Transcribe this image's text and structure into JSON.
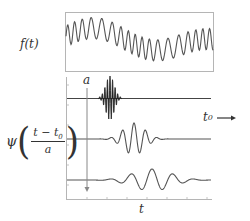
{
  "figure": {
    "signal_label": "f(t)",
    "wavelet_label": {
      "symbol": "ψ",
      "numerator": "t − t",
      "numerator_sub": "0",
      "denominator": "a"
    },
    "scale_label": "a",
    "shift_label": "t",
    "shift_label_sub": "0",
    "time_axis_label": "t",
    "colors": {
      "line": "#555555",
      "frame": "#aaaaaa",
      "burst": "#222222"
    },
    "rows": [
      {
        "name": "compressed-wavelet",
        "baseline_y": 98,
        "center_x": 110,
        "width": 9,
        "amplitude": 22
      },
      {
        "name": "medium-wavelet",
        "baseline_y": 139,
        "center_x": 134,
        "width": 22,
        "amplitude": 16
      },
      {
        "name": "dilated-wavelet",
        "baseline_y": 180,
        "center_x": 152,
        "width": 40,
        "amplitude": 11
      }
    ]
  }
}
